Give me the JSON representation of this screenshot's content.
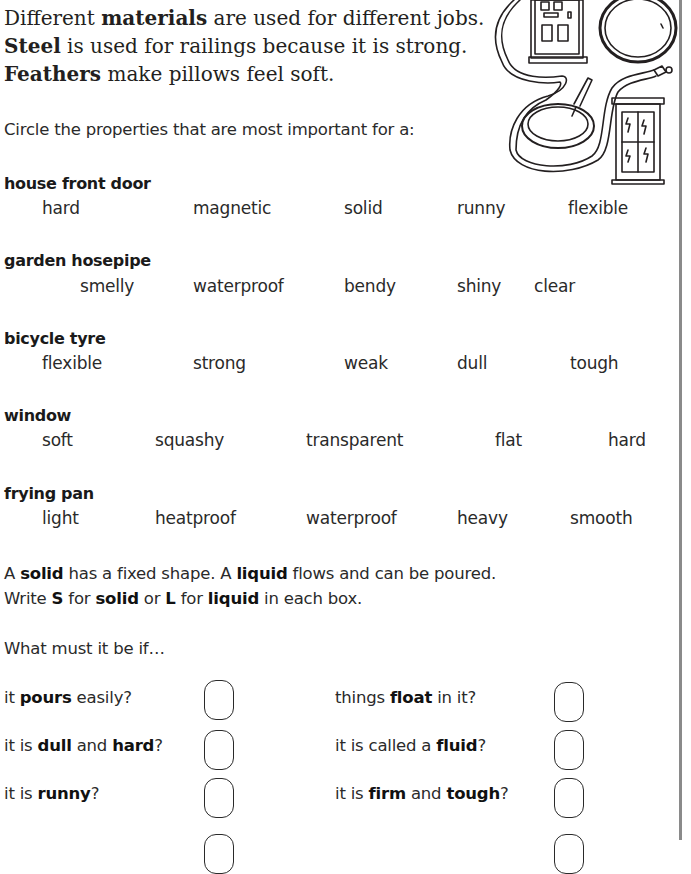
{
  "intro": {
    "line1": {
      "pre": "Different ",
      "bold": "materials",
      "post": " are used for different jobs."
    },
    "line2": {
      "bold": "Steel",
      "post": " is used for railings because it is strong."
    },
    "line3": {
      "bold": "Feathers",
      "post": " make pillows feel soft."
    }
  },
  "instruction": "Circle the properties that are most important for a:",
  "illustration": {
    "label": "door, hosepipe, tyre, frying pan and window illustration",
    "items": [
      "front door",
      "garden hosepipe",
      "bicycle tyre",
      "frying pan",
      "window"
    ]
  },
  "items": [
    {
      "title": "house front door",
      "properties": [
        "hard",
        "magnetic",
        "solid",
        "runny",
        "flexible"
      ]
    },
    {
      "title": "garden hosepipe",
      "properties": [
        "smelly",
        "waterproof",
        "bendy",
        "shiny",
        "clear"
      ]
    },
    {
      "title": "bicycle tyre",
      "properties": [
        "flexible",
        "strong",
        "weak",
        "dull",
        "tough"
      ]
    },
    {
      "title": "window",
      "properties": [
        "soft",
        "squashy",
        "transparent",
        "flat",
        "hard"
      ]
    },
    {
      "title": "frying pan",
      "properties": [
        "light",
        "heatproof",
        "waterproof",
        "heavy",
        "smooth"
      ]
    }
  ],
  "solid_liquid": {
    "line1": {
      "a": "A ",
      "b1": "solid",
      "c": " has a fixed shape. A ",
      "b2": "liquid",
      "d": " flows and can be poured."
    },
    "line2": {
      "a": "Write ",
      "b1": "S",
      "c": " for ",
      "b2": "solid",
      "d": " or ",
      "b3": "L",
      "e": " for ",
      "b4": "liquid",
      "f": " in each box."
    },
    "prompt": "What must it be if…"
  },
  "questions": {
    "left": [
      {
        "a": "it ",
        "b": "pours",
        "c": " easily?",
        "d": "",
        "e": ""
      },
      {
        "a": "it is ",
        "b": "dull",
        "c": " and ",
        "d": "hard",
        "e": "?"
      },
      {
        "a": "it is ",
        "b": "runny",
        "c": "?",
        "d": "",
        "e": ""
      }
    ],
    "right": [
      {
        "a": "things ",
        "b": "float",
        "c": " in it?",
        "d": "",
        "e": ""
      },
      {
        "a": "it is called a ",
        "b": "fluid",
        "c": "?",
        "d": "",
        "e": ""
      },
      {
        "a": "it is ",
        "b": "firm",
        "c": " and ",
        "d": "tough",
        "e": "?"
      }
    ],
    "answers": {
      "left": [
        "",
        "",
        "",
        ""
      ],
      "right": [
        "",
        "",
        "",
        ""
      ]
    }
  }
}
